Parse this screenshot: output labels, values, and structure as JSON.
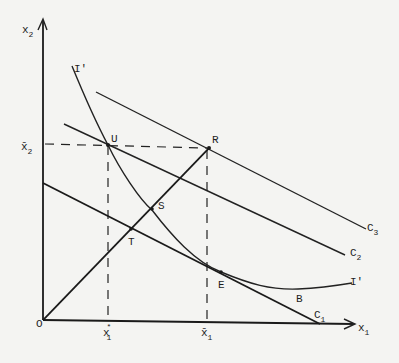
{
  "diagram": {
    "background": "#f4f4f2",
    "ink": "#1e1e1e",
    "axes": {
      "x_label": "x",
      "x_label_sub": "1",
      "y_label": "x",
      "y_label_sub": "2",
      "origin_label": "O"
    },
    "ticks": {
      "x_star": {
        "base": "x",
        "sup": "*",
        "sub": "1"
      },
      "x_bar": {
        "base": "x̄",
        "sub": "1"
      },
      "y_bar": {
        "base": "x̄",
        "sub": "2"
      }
    },
    "curves": {
      "isoquant_top_label": "I'",
      "isoquant_right_label": "I'"
    },
    "lines": {
      "c1": {
        "base": "C",
        "sub": "1"
      },
      "c2": {
        "base": "C",
        "sub": "2"
      },
      "c3": {
        "base": "C",
        "sub": "3"
      }
    },
    "points": {
      "U": "U",
      "R": "R",
      "S": "S",
      "T": "T",
      "E": "E",
      "B": "B"
    }
  }
}
